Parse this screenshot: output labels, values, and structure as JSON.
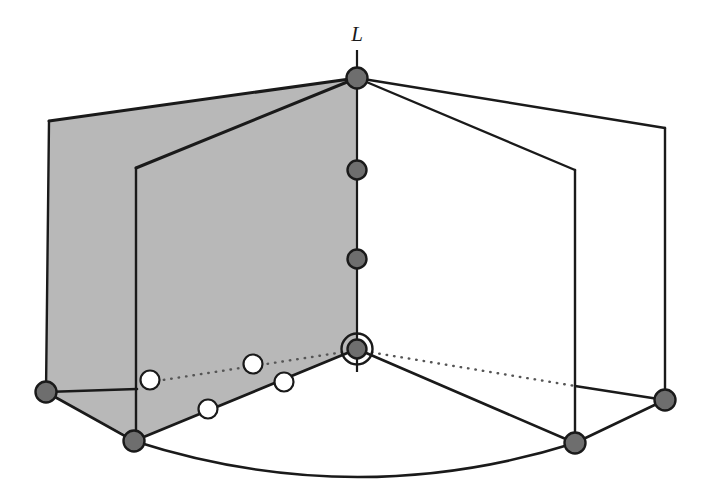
{
  "figure": {
    "title": "",
    "type": "3d-geometric-diagram",
    "canvas": {
      "width": 710,
      "height": 504,
      "background": "#ffffff"
    }
  },
  "colors": {
    "stroke": "#1a1a1a",
    "shaded_plane_fill": "#b8b8b8",
    "unshaded_plane_fill": "#ffffff",
    "filled_node_fill": "#6e6e6e",
    "open_node_fill": "#ffffff",
    "dotted_line": "#555555"
  },
  "labels": [
    {
      "name": "axis-label-L",
      "text": "L",
      "x": 357,
      "y": 41,
      "anchor": "middle"
    }
  ],
  "axis": {
    "name": "line-L",
    "x": 357,
    "y_top": 50,
    "y_bottom": 372,
    "stroke_width": 2.2
  },
  "planes": [
    {
      "name": "shaded-plane-outer",
      "shaded": true,
      "points": "357,78 49,121 46,392 136,440 357,349"
    },
    {
      "name": "shaded-plane-inner",
      "shaded": true,
      "points": "357,78 136,168 136,440 357,349"
    },
    {
      "name": "unshaded-plane-outer",
      "shaded": false,
      "points": "357,78 665,128 665,400 575,443 357,349"
    },
    {
      "name": "unshaded-plane-inner",
      "shaded": false,
      "points": "357,78 575,170 575,443 357,349"
    }
  ],
  "edges": [
    {
      "name": "edge-top-to-outer-left",
      "x1": 357,
      "y1": 78,
      "x2": 49,
      "y2": 121,
      "width": 3.0
    },
    {
      "name": "edge-top-to-inner-left",
      "x1": 357,
      "y1": 78,
      "x2": 136,
      "y2": 168,
      "width": 3.0
    },
    {
      "name": "edge-top-to-outer-right",
      "x1": 357,
      "y1": 78,
      "x2": 665,
      "y2": 128,
      "width": 2.4
    },
    {
      "name": "edge-top-to-inner-right",
      "x1": 357,
      "y1": 78,
      "x2": 575,
      "y2": 170,
      "width": 2.4
    },
    {
      "name": "edge-outer-left-vertical",
      "x1": 49,
      "y1": 121,
      "x2": 46,
      "y2": 392,
      "width": 2.4
    },
    {
      "name": "edge-inner-left-vertical",
      "x1": 136,
      "y1": 168,
      "x2": 136,
      "y2": 440,
      "width": 2.4
    },
    {
      "name": "edge-outer-right-vertical",
      "x1": 665,
      "y1": 128,
      "x2": 665,
      "y2": 400,
      "width": 2.4
    },
    {
      "name": "edge-inner-right-vertical",
      "x1": 575,
      "y1": 170,
      "x2": 575,
      "y2": 443,
      "width": 2.4
    },
    {
      "name": "edge-outer-left-to-inner-left-base",
      "x1": 46,
      "y1": 392,
      "x2": 137,
      "y2": 389,
      "width": 2.6
    },
    {
      "name": "edge-outer-left-to-bottom-left",
      "x1": 46,
      "y1": 392,
      "x2": 134,
      "y2": 441,
      "width": 2.6
    },
    {
      "name": "edge-bottom-left-to-origin",
      "x1": 134,
      "y1": 441,
      "x2": 357,
      "y2": 349,
      "width": 2.8
    },
    {
      "name": "edge-origin-to-bottom-right",
      "x1": 357,
      "y1": 349,
      "x2": 575,
      "y2": 443,
      "width": 2.6
    },
    {
      "name": "edge-bottom-right-to-outer-right",
      "x1": 575,
      "y1": 443,
      "x2": 665,
      "y2": 400,
      "width": 2.6
    },
    {
      "name": "edge-inner-right-base-to-outer-right",
      "x1": 575,
      "y1": 386,
      "x2": 665,
      "y2": 400,
      "width": 2.4
    }
  ],
  "dotted_edges": [
    {
      "name": "dotted-origin-to-left-plane",
      "x1": 357,
      "y1": 350,
      "x2": 137,
      "y2": 384
    },
    {
      "name": "dotted-origin-to-right-plane",
      "x1": 357,
      "y1": 350,
      "x2": 575,
      "y2": 386
    }
  ],
  "arc": {
    "name": "base-arc",
    "path": "M 134,441 Q 355,512 575,443",
    "width": 2.6
  },
  "filled_nodes": [
    {
      "name": "node-line-top",
      "x": 357,
      "y": 78,
      "r": 10.5
    },
    {
      "name": "node-line-upper-mid",
      "x": 357,
      "y": 170,
      "r": 9.5
    },
    {
      "name": "node-line-lower-mid",
      "x": 357,
      "y": 259,
      "r": 9.5
    },
    {
      "name": "node-origin",
      "x": 357,
      "y": 349,
      "r": 9.5,
      "ring": true,
      "ring_r": 15.5
    },
    {
      "name": "node-outer-left-base",
      "x": 46,
      "y": 392,
      "r": 10.5
    },
    {
      "name": "node-inner-left-base",
      "x": 134,
      "y": 441,
      "r": 10.5
    },
    {
      "name": "node-inner-right-base",
      "x": 575,
      "y": 443,
      "r": 10.5
    },
    {
      "name": "node-outer-right-base",
      "x": 665,
      "y": 400,
      "r": 10.5
    }
  ],
  "open_nodes": [
    {
      "name": "open-node-1",
      "x": 150,
      "y": 380,
      "r": 9.5
    },
    {
      "name": "open-node-2",
      "x": 253,
      "y": 364,
      "r": 9.5
    },
    {
      "name": "open-node-3",
      "x": 284,
      "y": 382,
      "r": 9.5
    },
    {
      "name": "open-node-4",
      "x": 208,
      "y": 409,
      "r": 9.5
    }
  ]
}
